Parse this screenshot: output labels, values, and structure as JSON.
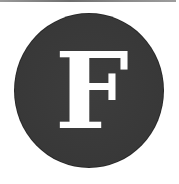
{
  "logo": {
    "letter": "F",
    "shape": "circle",
    "colors": {
      "background": "#ffffff",
      "circle_fill": "#3a3a3a",
      "letter": "#ffffff",
      "top_rule": "#7a7a7a"
    }
  }
}
